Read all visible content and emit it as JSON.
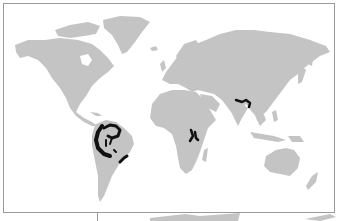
{
  "map": {
    "type": "world-distribution-map",
    "colors": {
      "background": "#ffffff",
      "land": "#c4c4c4",
      "distribution": "#111111",
      "frame": "#9a9a9a"
    },
    "distribution_regions": [
      {
        "name": "northern-andes-amazon",
        "label": "Northwestern South America"
      },
      {
        "name": "eastern-brazil",
        "label": "Eastern Brazil"
      },
      {
        "name": "east-africa-rift",
        "label": "East African Rift"
      },
      {
        "name": "himalaya-southwest-china",
        "label": "Eastern Himalaya / SW China"
      }
    ]
  }
}
